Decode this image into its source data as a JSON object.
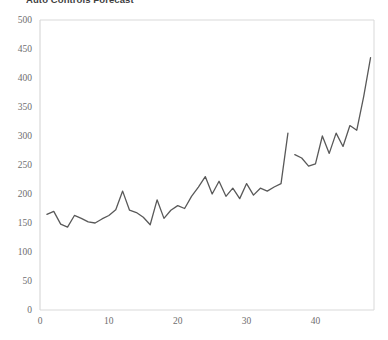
{
  "chart_data": {
    "type": "line",
    "title": "Auto Controls Forecast",
    "title_clipped": true,
    "xlabel": "",
    "ylabel": "",
    "xlim": [
      0,
      48.5
    ],
    "ylim": [
      0,
      500
    ],
    "ytick_labels": [
      "0",
      "50",
      "100",
      "150",
      "200",
      "250",
      "300",
      "350",
      "400",
      "450",
      "500"
    ],
    "yticks": [
      0,
      50,
      100,
      150,
      200,
      250,
      300,
      350,
      400,
      450,
      500
    ],
    "xtick_labels": [
      "0",
      "10",
      "20",
      "30",
      "40"
    ],
    "xticks": [
      0,
      10,
      20,
      30,
      40
    ],
    "grid": false,
    "legend": "none",
    "line_color": "#595959",
    "axis_color": "#d9d9d9",
    "tick_label_color": "#6e6e6e",
    "series": [
      {
        "name": "Actual",
        "x": [
          1,
          2,
          3,
          4,
          5,
          6,
          7,
          8,
          9,
          10,
          11,
          12,
          13,
          14,
          15,
          16,
          17,
          18,
          19,
          20,
          21,
          22,
          23,
          24,
          25,
          26,
          27,
          28,
          29,
          30,
          31,
          32,
          33,
          34,
          35,
          36
        ],
        "values": [
          165,
          170,
          148,
          143,
          163,
          158,
          152,
          150,
          157,
          163,
          173,
          205,
          172,
          168,
          160,
          147,
          190,
          158,
          172,
          180,
          175,
          196,
          212,
          230,
          200,
          222,
          196,
          210,
          192,
          218,
          198,
          210,
          205,
          212,
          218,
          305
        ]
      },
      {
        "name": "Forecast",
        "x": [
          37,
          38,
          39,
          40,
          41,
          42,
          43,
          44,
          45,
          46,
          47,
          48
        ],
        "values": [
          268,
          262,
          248,
          252,
          300,
          270,
          305,
          282,
          318,
          310,
          368,
          435
        ]
      }
    ]
  }
}
